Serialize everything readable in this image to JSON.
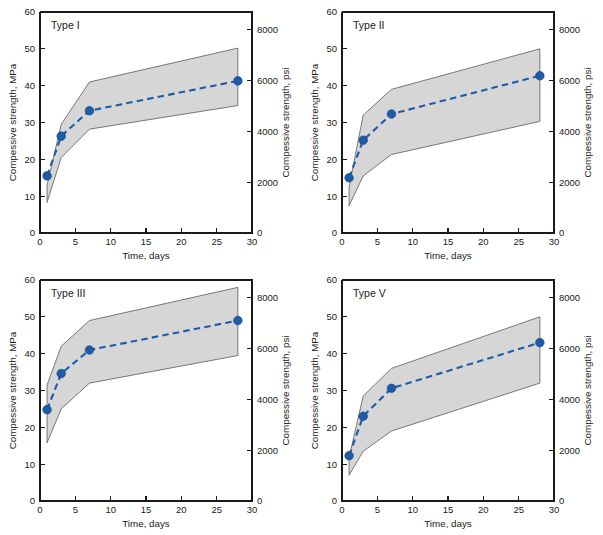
{
  "figure": {
    "layout": "2x2 grid of line charts with shaded range bands",
    "background_color": "#ffffff",
    "series_color": "#1d5ca8",
    "band_fill_color": "#d6d6d6",
    "band_stroke_color": "#5a5a5a",
    "axis_color": "#1a1a1a"
  },
  "axes": {
    "x_label": "Time, days",
    "y_left_label": "Compessive strength, MPa",
    "y_right_label": "Compessive strength, psi",
    "x_ticks": [
      0,
      5,
      10,
      15,
      20,
      25,
      30
    ],
    "y_left_ticks": [
      0,
      10,
      20,
      30,
      40,
      50,
      60
    ],
    "y_right_ticks": [
      0,
      2000,
      4000,
      6000,
      8000
    ],
    "x_range": [
      0,
      30
    ],
    "y_left_range": [
      0,
      60
    ],
    "y_right_range": [
      0,
      8700
    ],
    "grid": "off",
    "legend": "none"
  },
  "chart_data": [
    {
      "type": "line",
      "panel_label": "Type I",
      "title": "Type I",
      "xlabel": "Time, days",
      "ylabel": "Compessive strength, MPa",
      "ylabel_right": "Compessive strength, psi",
      "xlim": [
        0,
        30
      ],
      "ylim": [
        0,
        60
      ],
      "x": [
        1,
        3,
        7,
        28
      ],
      "values": [
        15.5,
        26.3,
        33.2,
        41.3
      ],
      "band_upper": [
        13.0,
        29.5,
        41.0,
        50.2
      ],
      "band_lower": [
        8.3,
        20.5,
        28.2,
        34.6
      ],
      "marker": "filled-circle",
      "linestyle": "dashed"
    },
    {
      "type": "line",
      "panel_label": "Type II",
      "title": "Type II",
      "xlabel": "Time, days",
      "ylabel": "Compessive strength, MPa",
      "ylabel_right": "Compessive strength, psi",
      "xlim": [
        0,
        30
      ],
      "ylim": [
        0,
        60
      ],
      "x": [
        1,
        3,
        7,
        28
      ],
      "values": [
        15.0,
        25.2,
        32.3,
        42.7
      ],
      "band_upper": [
        12.5,
        32.0,
        39.0,
        50.0
      ],
      "band_lower": [
        7.4,
        15.5,
        21.3,
        30.3
      ],
      "marker": "filled-circle",
      "linestyle": "dashed"
    },
    {
      "type": "line",
      "panel_label": "Type III",
      "title": "Type III",
      "xlabel": "Time, days",
      "ylabel": "Compessive strength, MPa",
      "ylabel_right": "Compessive strength, psi",
      "xlim": [
        0,
        30
      ],
      "ylim": [
        0,
        60
      ],
      "x": [
        1,
        3,
        7,
        28
      ],
      "values": [
        24.8,
        34.6,
        41.0,
        49.0
      ],
      "band_upper": [
        31.5,
        42.0,
        49.0,
        58.0
      ],
      "band_lower": [
        15.8,
        25.0,
        32.0,
        39.5
      ],
      "marker": "filled-circle",
      "linestyle": "dashed"
    },
    {
      "type": "line",
      "panel_label": "Type V",
      "title": "Type V",
      "xlabel": "Time, days",
      "ylabel": "Compessive strength, MPa",
      "ylabel_right": "Compessive strength, psi",
      "xlim": [
        0,
        30
      ],
      "ylim": [
        0,
        60
      ],
      "x": [
        1,
        3,
        7,
        28
      ],
      "values": [
        12.3,
        23.0,
        30.6,
        43.0
      ],
      "band_upper": [
        11.8,
        28.5,
        36.0,
        50.0
      ],
      "band_lower": [
        7.0,
        13.5,
        19.0,
        32.0
      ],
      "marker": "filled-circle",
      "linestyle": "dashed"
    }
  ]
}
